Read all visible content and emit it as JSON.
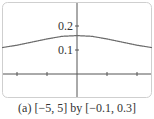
{
  "chart_data": {
    "type": "line",
    "title": "",
    "caption": "(a) [−5, 5] by [−0.1, 0.3]",
    "xlabel": "",
    "ylabel": "",
    "xlim": [
      -5,
      5
    ],
    "ylim": [
      -0.1,
      0.3
    ],
    "x_ticks": [
      -4,
      -2,
      2,
      4
    ],
    "y_ticks": [
      0.1,
      0.2
    ],
    "y_tick_labels": [
      "0.1",
      "0.2"
    ],
    "grid": false,
    "legend": null,
    "series": [
      {
        "name": "f(x)",
        "x": [
          -5,
          -4,
          -3,
          -2,
          -1,
          0,
          1,
          2,
          3,
          4,
          5
        ],
        "y": [
          0.11,
          0.12,
          0.133,
          0.146,
          0.157,
          0.16,
          0.157,
          0.146,
          0.133,
          0.12,
          0.11
        ]
      }
    ]
  },
  "colors": {
    "frame": "#cfcfcf",
    "axis": "#555555",
    "curve": "#6b6b6b",
    "text": "#333333"
  }
}
